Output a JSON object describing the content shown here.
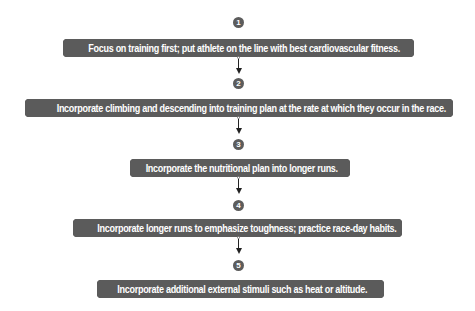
{
  "diagram": {
    "type": "vertical-flowchart",
    "colors": {
      "box_fill": "#5b5b5b",
      "box_text": "#ffffff",
      "number_fill": "#5c5c5c",
      "arrow": "#222222",
      "background": "#ffffff"
    },
    "steps": [
      {
        "number": "1",
        "text": "Focus on training first; put athlete on the line with best cardiovascular fitness."
      },
      {
        "number": "2",
        "text": "Incorporate climbing and descending into training plan at the rate at which they occur in the race."
      },
      {
        "number": "3",
        "text": "Incorporate the nutritional plan into longer runs."
      },
      {
        "number": "4",
        "text": "Incorporate longer runs to emphasize toughness; practice race-day habits."
      },
      {
        "number": "5",
        "text": "Incorporate additional external stimuli such as heat or altitude."
      }
    ]
  }
}
